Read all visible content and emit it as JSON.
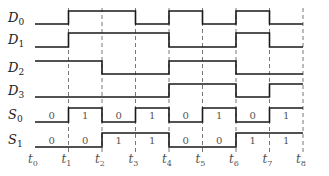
{
  "diagram": {
    "type": "timing-diagram",
    "time_markers": [
      {
        "base": "t",
        "sub": "0"
      },
      {
        "base": "t",
        "sub": "1"
      },
      {
        "base": "t",
        "sub": "2"
      },
      {
        "base": "t",
        "sub": "3"
      },
      {
        "base": "t",
        "sub": "4"
      },
      {
        "base": "t",
        "sub": "5"
      },
      {
        "base": "t",
        "sub": "6"
      },
      {
        "base": "t",
        "sub": "7"
      },
      {
        "base": "t",
        "sub": "8"
      }
    ],
    "signals": [
      {
        "base": "D",
        "sub": "0",
        "values": [
          0,
          1,
          1,
          0,
          1,
          0,
          1,
          0
        ]
      },
      {
        "base": "D",
        "sub": "1",
        "values": [
          0,
          1,
          1,
          1,
          0,
          0,
          1,
          0
        ]
      },
      {
        "base": "D",
        "sub": "2",
        "values": [
          1,
          1,
          0,
          0,
          1,
          1,
          0,
          0
        ]
      },
      {
        "base": "D",
        "sub": "3",
        "values": [
          0,
          0,
          0,
          0,
          1,
          1,
          0,
          1
        ]
      },
      {
        "base": "S",
        "sub": "0",
        "values": [
          0,
          1,
          0,
          1,
          0,
          1,
          0,
          1
        ],
        "show_bits": true,
        "bit_labels": [
          "0",
          "1",
          "0",
          "1",
          "0",
          "1",
          "0",
          "1"
        ]
      },
      {
        "base": "S",
        "sub": "1",
        "values": [
          0,
          0,
          1,
          1,
          0,
          0,
          1,
          1
        ],
        "show_bits": true,
        "bit_labels": [
          "0",
          "0",
          "1",
          "1",
          "0",
          "0",
          "1",
          "1"
        ]
      }
    ],
    "colors": {
      "signal": "#1a1a1a",
      "grid": "#555555",
      "text": "#222222"
    }
  }
}
